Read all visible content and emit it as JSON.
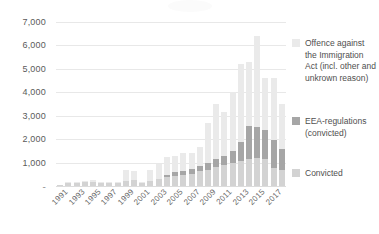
{
  "chart_data": {
    "type": "bar",
    "title": "",
    "subtitle": "",
    "xlabel": "",
    "ylabel": "",
    "ylim": [
      0,
      7000
    ],
    "ytick_step": 1000,
    "ytick_labels": [
      "7,000",
      "6,000",
      "5,000",
      "4,000",
      "3,000",
      "2,000",
      "1,000",
      "-"
    ],
    "ytick_values": [
      7000,
      6000,
      5000,
      4000,
      3000,
      2000,
      1000,
      0
    ],
    "grid": true,
    "stacked": true,
    "legend_position": "right",
    "categories": [
      "1991",
      "1992",
      "1993",
      "1994",
      "1995",
      "1996",
      "1997",
      "1998",
      "1999",
      "2000",
      "2001",
      "2002",
      "2003",
      "2004",
      "2005",
      "2006",
      "2007",
      "2008",
      "2009",
      "2010",
      "2011",
      "2012",
      "2013",
      "2014",
      "2015",
      "2016",
      "2017",
      "2018"
    ],
    "visible_tick_labels": [
      "1991",
      "1993",
      "1995",
      "1997",
      "1999",
      "2001",
      "2003",
      "2005",
      "2007",
      "2009",
      "2011",
      "2013",
      "2015",
      "2017"
    ],
    "series": [
      {
        "name": "Convicted",
        "color": "#d3d3d3",
        "values": [
          60,
          120,
          140,
          160,
          180,
          150,
          130,
          150,
          230,
          250,
          130,
          230,
          300,
          380,
          420,
          460,
          520,
          620,
          700,
          820,
          900,
          1000,
          1060,
          1150,
          1180,
          1150,
          780,
          700
        ]
      },
      {
        "name": "EEA-regulations (convicted)",
        "color": "#a6a6a6",
        "values": [
          0,
          0,
          0,
          0,
          0,
          0,
          0,
          0,
          0,
          0,
          0,
          0,
          0,
          110,
          160,
          180,
          200,
          240,
          300,
          320,
          400,
          500,
          840,
          1430,
          1350,
          1220,
          1170,
          880
        ]
      },
      {
        "name": "Offence against the Immigration Act (incl. other and unkrown reason)",
        "color": "#eaeaea",
        "values": [
          0,
          20,
          30,
          50,
          70,
          40,
          30,
          40,
          440,
          400,
          30,
          450,
          620,
          740,
          720,
          760,
          700,
          820,
          1670,
          2340,
          1860,
          2520,
          3320,
          2710,
          3870,
          2220,
          2660,
          1910
        ]
      }
    ],
    "totals": [
      60,
      140,
      170,
      210,
      250,
      190,
      160,
      190,
      670,
      650,
      160,
      680,
      920,
      1230,
      1300,
      1400,
      1420,
      1680,
      2670,
      3480,
      3160,
      4020,
      5220,
      5290,
      6400,
      4590,
      4610,
      3490
    ]
  },
  "legend": {
    "items": [
      {
        "label": "Offence against the Immigration Act (incl. other and unkrown reason)",
        "color": "#eaeaea"
      },
      {
        "label": "EEA-regulations (convicted)",
        "color": "#a6a6a6"
      },
      {
        "label": "Convicted",
        "color": "#d3d3d3"
      }
    ]
  }
}
